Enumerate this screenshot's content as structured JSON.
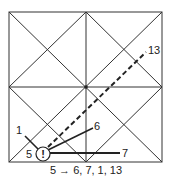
{
  "diagram": {
    "type": "tatami-grid-movement",
    "square": {
      "x1": 9,
      "y1": 12,
      "x2": 162,
      "y2": 162
    },
    "colors": {
      "stroke": "#333333",
      "text": "#222222",
      "background": "#ffffff"
    },
    "origin": {
      "label": "5",
      "symbol": "!",
      "cx": 43,
      "cy": 154,
      "r": 7
    },
    "targets": [
      {
        "label": "6",
        "style": "solid"
      },
      {
        "label": "7",
        "style": "solid"
      },
      {
        "label": "1",
        "style": "solid"
      },
      {
        "label": "13",
        "style": "dashed"
      }
    ],
    "caption": "5 → 6, 7, 1, 13"
  }
}
